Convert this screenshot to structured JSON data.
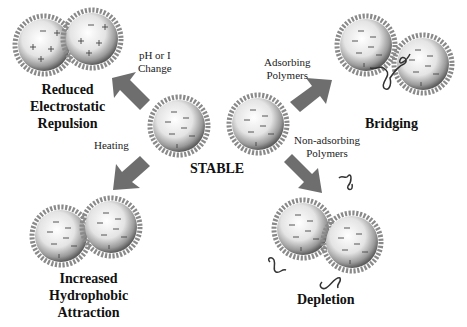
{
  "center": {
    "label": "STABLE"
  },
  "conditions": {
    "ph": {
      "line1": "pH or I",
      "line2": "Change"
    },
    "heating": {
      "label": "Heating"
    },
    "adsorbing": {
      "line1": "Adsorbing",
      "line2": "Polymers"
    },
    "nonadsorbing": {
      "line1": "Non-adsorbing",
      "line2": "Polymers"
    }
  },
  "outcomes": {
    "electrostatic": {
      "line1": "Reduced",
      "line2": "Electrostatic",
      "line3": "Repulsion"
    },
    "hydrophobic": {
      "line1": "Increased",
      "line2": "Hydrophobic",
      "line3": "Attraction"
    },
    "bridging": {
      "label": "Bridging"
    },
    "depletion": {
      "label": "Depletion"
    }
  },
  "colors": {
    "arrow": "#6e6e6e",
    "shell": "#8a8a8a",
    "sphere_center": "#ffffff",
    "sphere_edge": "#6a6a6a",
    "polymer": "#333333"
  }
}
